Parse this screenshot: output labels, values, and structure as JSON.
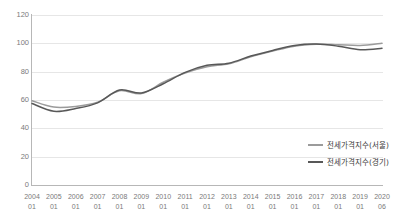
{
  "chart_data": {
    "type": "line",
    "title": "",
    "xlabel": "",
    "ylabel": "",
    "ylim": [
      0,
      120
    ],
    "yticks": [
      0,
      20,
      40,
      60,
      80,
      100,
      120
    ],
    "grid": true,
    "legend_position": "right-inside",
    "categories": [
      "2004 01",
      "2005 01",
      "2006 01",
      "2007 01",
      "2008 01",
      "2009 01",
      "2010 01",
      "2011 01",
      "2012 01",
      "2013 01",
      "2014 01",
      "2015 01",
      "2016 01",
      "2017 01",
      "2018 01",
      "2019 01",
      "2020 06"
    ],
    "series": [
      {
        "name": "전세가격지수(서울)",
        "color": "#9b9b9b",
        "values": [
          59.5,
          55.0,
          55.5,
          58.5,
          66.5,
          64.5,
          72.5,
          79.0,
          83.5,
          85.5,
          90.5,
          94.5,
          98.0,
          99.3,
          99.0,
          98.5,
          100.0
        ]
      },
      {
        "name": "전세가격지수(경기)",
        "color": "#585858",
        "values": [
          57.5,
          52.0,
          54.0,
          58.0,
          67.0,
          65.0,
          71.5,
          79.5,
          84.5,
          86.0,
          91.0,
          95.0,
          98.5,
          99.5,
          98.0,
          95.5,
          96.5
        ]
      }
    ]
  },
  "axes": {
    "y_ticks": [
      "0",
      "20",
      "40",
      "60",
      "80",
      "100",
      "120"
    ],
    "x_ticks": [
      {
        "year": "2004",
        "month": "01"
      },
      {
        "year": "2005",
        "month": "01"
      },
      {
        "year": "2006",
        "month": "01"
      },
      {
        "year": "2007",
        "month": "01"
      },
      {
        "year": "2008",
        "month": "01"
      },
      {
        "year": "2009",
        "month": "01"
      },
      {
        "year": "2010",
        "month": "01"
      },
      {
        "year": "2011",
        "month": "01"
      },
      {
        "year": "2012",
        "month": "01"
      },
      {
        "year": "2013",
        "month": "01"
      },
      {
        "year": "2014",
        "month": "01"
      },
      {
        "year": "2015",
        "month": "01"
      },
      {
        "year": "2016",
        "month": "01"
      },
      {
        "year": "2017",
        "month": "01"
      },
      {
        "year": "2018",
        "month": "01"
      },
      {
        "year": "2019",
        "month": "01"
      },
      {
        "year": "2020",
        "month": "06"
      }
    ]
  },
  "legend": {
    "items": [
      {
        "label": "전세가격지수(서울)",
        "color": "#9b9b9b"
      },
      {
        "label": "전세가격지수(경기)",
        "color": "#585858"
      }
    ]
  },
  "colors": {
    "grid": "#e6e6e6",
    "axis": "#b7b7b7",
    "tick_text": "#7a7a7a",
    "legend_text": "#3a3a3a",
    "background": "#ffffff"
  }
}
